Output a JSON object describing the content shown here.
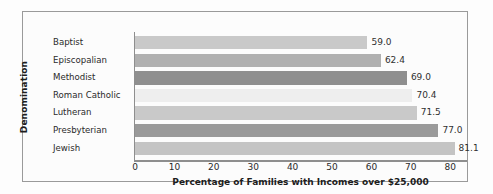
{
  "chart_data": {
    "type": "bar",
    "orientation": "horizontal",
    "title": "",
    "xlabel": "Percentage of Families with Incomes over $25,000",
    "ylabel": "Denomination",
    "categories": [
      "Baptist",
      "Episcopalian",
      "Methodist",
      "Roman Catholic",
      "Lutheran",
      "Presbyterian",
      "Jewish"
    ],
    "values": [
      59.0,
      62.4,
      69.0,
      70.4,
      71.5,
      77.0,
      81.1
    ],
    "value_labels": [
      "59.0",
      "62.4",
      "69.0",
      "70.4",
      "71.5",
      "77.0",
      "81.1"
    ],
    "bar_colors": [
      "#c9c9c9",
      "#b0b0b0",
      "#8f8f8f",
      "#eeeeee",
      "#c9c9c9",
      "#9a9a9a",
      "#c4c4c4"
    ],
    "xlim": [
      0,
      84
    ],
    "xticks": [
      0,
      10,
      20,
      30,
      40,
      50,
      60,
      70,
      80
    ],
    "xtick_labels": [
      "0",
      "10",
      "20",
      "30",
      "40",
      "50",
      "60",
      "70",
      "80"
    ],
    "grid": false,
    "legend": "none",
    "frame_color": "#9a9a9a",
    "axis_color": "#8e8e8e",
    "background": "#fcfcfc"
  }
}
